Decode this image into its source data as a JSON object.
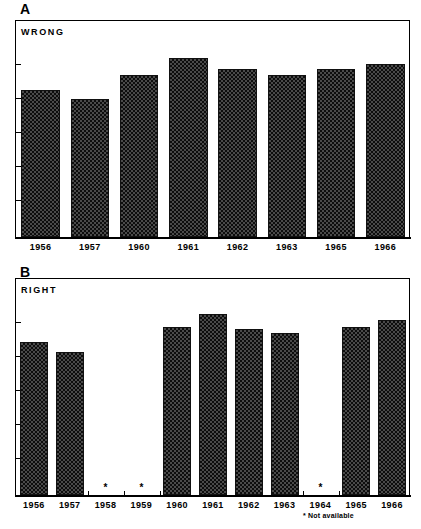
{
  "figure": {
    "panels": [
      {
        "letter": "A",
        "caption": "WRONG",
        "footnote": ""
      },
      {
        "letter": "B",
        "caption": "RIGHT",
        "footnote": "* Not available"
      }
    ]
  },
  "chart_data": [
    {
      "type": "bar",
      "title": "WRONG",
      "panel": "A",
      "xlabel": "",
      "ylabel": "",
      "grid": false,
      "legend": null,
      "ylim": [
        0,
        100
      ],
      "axis_ticks_count": 5,
      "categories": [
        "1956",
        "1957",
        "1960",
        "1961",
        "1962",
        "1963",
        "1965",
        "1966"
      ],
      "values": [
        68,
        64,
        75,
        83,
        78,
        75,
        78,
        80
      ],
      "bar_pattern": "checkerboard",
      "notes": "Unlabeled vertical axis with 5 unlabeled tick marks on both left and right sides; values estimated as percent of plot height."
    },
    {
      "type": "bar",
      "title": "RIGHT",
      "panel": "B",
      "xlabel": "",
      "ylabel": "",
      "grid": false,
      "legend": null,
      "ylim": [
        0,
        100
      ],
      "axis_ticks_count": 5,
      "categories": [
        "1956",
        "1957",
        "1958",
        "1959",
        "1960",
        "1961",
        "1962",
        "1963",
        "1964",
        "1965",
        "1966"
      ],
      "values": [
        71,
        66,
        null,
        null,
        78,
        84,
        77,
        75,
        null,
        78,
        81
      ],
      "missing_categories": [
        "1958",
        "1959",
        "1964"
      ],
      "missing_marker": "*",
      "bar_pattern": "checkerboard",
      "notes": "Asterisks mark years with no data; footnote reads '* Not available'."
    }
  ],
  "panel_a": {
    "letter": "A",
    "caption": "WRONG",
    "labels": [
      "1956",
      "1957",
      "1960",
      "1961",
      "1962",
      "1963",
      "1965",
      "1966"
    ],
    "heights_pct": [
      68,
      64,
      75,
      83,
      78,
      75,
      78,
      80
    ]
  },
  "panel_b": {
    "letter": "B",
    "caption": "RIGHT",
    "labels": [
      "1956",
      "1957",
      "1958",
      "1959",
      "1960",
      "1961",
      "1962",
      "1963",
      "1964",
      "1965",
      "1966"
    ],
    "heights_pct": [
      71,
      66,
      0,
      0,
      78,
      84,
      77,
      75,
      0,
      78,
      81
    ],
    "stars": [
      "",
      "",
      "*",
      "*",
      "",
      "",
      "",
      "",
      "*",
      "",
      ""
    ],
    "footnote": "* Not available"
  },
  "colors": {
    "ink": "#000000",
    "bar_fill": "#4a4a4a",
    "bar_pattern": "#0d0d0d",
    "background": "#ffffff"
  }
}
